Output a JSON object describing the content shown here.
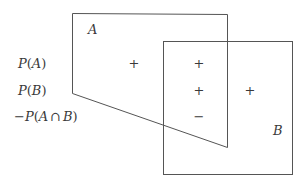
{
  "diagram": {
    "type": "venn-inclusion-exclusion",
    "sets": [
      {
        "name": "A",
        "label": "A"
      },
      {
        "name": "B",
        "label": "B"
      }
    ],
    "terms": [
      {
        "id": "pa",
        "label": "P(A)",
        "prefix": "",
        "func": "P",
        "open": "(",
        "arg": "A",
        "close": ")"
      },
      {
        "id": "pb",
        "label": "P(B)",
        "prefix": "",
        "func": "P",
        "open": "(",
        "arg": "B",
        "close": ")"
      },
      {
        "id": "pab",
        "label": "−P(A ∩ B)",
        "prefix": "−",
        "func": "P",
        "open": "(",
        "arg_a": "A",
        "cap": "∩",
        "arg_b": "B",
        "close": ")"
      }
    ],
    "signs": {
      "a_only_pa": "+",
      "intersection_pa": "+",
      "intersection_pb": "+",
      "b_only_pb": "+",
      "intersection_pab": "−"
    },
    "colors": {
      "stroke": "#555555",
      "text": "#3a3a3a",
      "background": "#ffffff"
    }
  }
}
